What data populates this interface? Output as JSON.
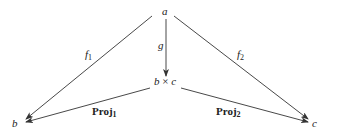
{
  "diagram": {
    "type": "commutative-diagram",
    "nodes": {
      "a": "a",
      "product_left": "b",
      "product_op": "×",
      "product_right": "c",
      "b": "b",
      "c": "c"
    },
    "arrows": {
      "f1": {
        "name": "f",
        "sub": "1",
        "from": "a",
        "to": "b"
      },
      "f2": {
        "name": "f",
        "sub": "2",
        "from": "a",
        "to": "c"
      },
      "g": {
        "name": "g",
        "from": "a",
        "to": "b × c"
      },
      "proj1": {
        "name": "Proj",
        "sub": "1",
        "from": "b × c",
        "to": "b"
      },
      "proj2": {
        "name": "Proj",
        "sub": "2",
        "from": "b × c",
        "to": "c"
      }
    },
    "colors": {
      "stroke": "#333333",
      "text": "#222222"
    }
  }
}
